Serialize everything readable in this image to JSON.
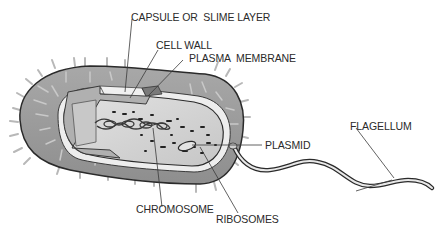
{
  "diagram": {
    "labels": {
      "capsule": "CAPSULE OR  SLIME LAYER",
      "cell_wall": "CELL WALL",
      "plasma_membrane": "PLASMA  MEMBRANE",
      "flagellum": "FLAGELLUM",
      "plasmid": "PLASMID",
      "chromosome": "CHROMOSOME",
      "ribosomes": "RIBOSOMES"
    },
    "colors": {
      "capsule": "#9a9a9a",
      "cell_wall": "#d6d6d6",
      "cytoplasm": "#c4c4c4",
      "cytoplasm_light": "#dedede",
      "outline": "#2a2a2a",
      "leader_line": "#3a3a3a",
      "background": "#ffffff"
    }
  }
}
